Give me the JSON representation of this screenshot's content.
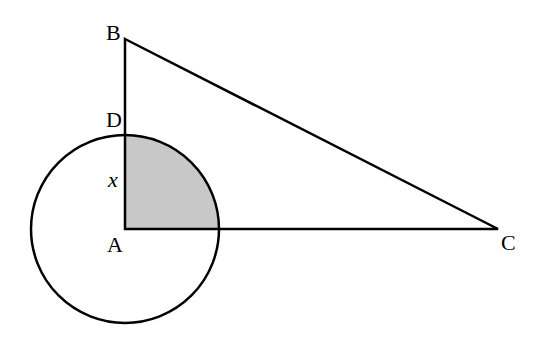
{
  "diagram": {
    "labels": {
      "B": "B",
      "D": "D",
      "x": "x",
      "A": "A",
      "C": "C"
    },
    "colors": {
      "stroke": "#000000",
      "shade": "#c8c8c8",
      "background": "#ffffff"
    },
    "points": {
      "A": [
        125,
        229
      ],
      "B": [
        125,
        39
      ],
      "C": [
        498,
        229
      ],
      "D": [
        125,
        135
      ]
    },
    "circle": {
      "center": "A",
      "radius": 94
    },
    "shaded_region": "quarter circle between AD and AC"
  }
}
